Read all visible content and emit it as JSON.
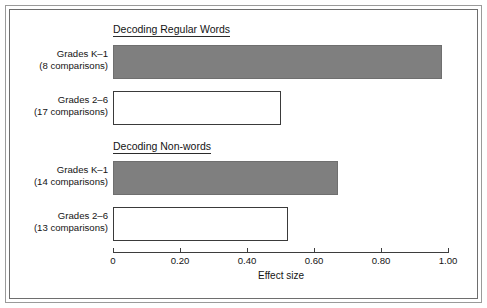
{
  "chart_data": {
    "type": "bar",
    "orientation": "horizontal",
    "title": "",
    "xlabel": "Effect size",
    "ylabel": "",
    "xlim": [
      0,
      1.0
    ],
    "grid": false,
    "legend": null,
    "tick_labels": [
      "0",
      "0.20",
      "0.40",
      "0.60",
      "0.80",
      "1.00"
    ],
    "tick_values": [
      0,
      0.2,
      0.4,
      0.6,
      0.8,
      1.0
    ],
    "groups": [
      {
        "title": "Decoding Regular Words",
        "bars": [
          {
            "label_line1": "Grades K–1",
            "label_line2": "(8 comparisons)",
            "value": 0.98,
            "style": "filled"
          },
          {
            "label_line1": "Grades 2–6",
            "label_line2": "(17 comparisons)",
            "value": 0.5,
            "style": "hollow"
          }
        ]
      },
      {
        "title": "Decoding Non-words",
        "bars": [
          {
            "label_line1": "Grades K–1",
            "label_line2": "(14 comparisons)",
            "value": 0.67,
            "style": "filled"
          },
          {
            "label_line1": "Grades 2–6",
            "label_line2": "(13 comparisons)",
            "value": 0.52,
            "style": "hollow"
          }
        ]
      }
    ],
    "colors": {
      "filled_bar": "#7f7f7f",
      "hollow_bar": "#ffffff",
      "bar_outline": "#3a3a3a",
      "axis": "#3d3d3d",
      "text": "#141414",
      "frame_outer": "#9a9a9a",
      "frame_inner": "#6e6e6e",
      "background": "#ffffff"
    }
  }
}
